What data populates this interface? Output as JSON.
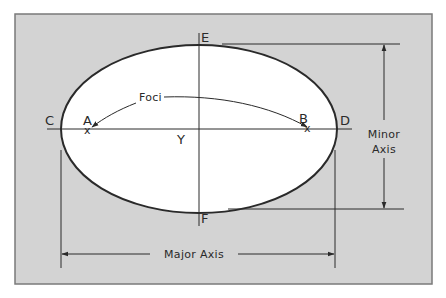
{
  "colors": {
    "background": "#ffffff",
    "panel": "#d3d3d3",
    "panel_border": "#7a7a7a",
    "ellipse_fill": "#ffffff",
    "line": "#2a2a2a"
  },
  "points": {
    "A": "A",
    "B": "B",
    "C": "C",
    "D": "D",
    "E": "E",
    "F": "F",
    "Y": "Y"
  },
  "labels": {
    "foci": "Foci",
    "minor_axis_line1": "Minor",
    "minor_axis_line2": "Axis",
    "major_axis": "Major Axis"
  },
  "markers": {
    "focus_mark": "x"
  }
}
